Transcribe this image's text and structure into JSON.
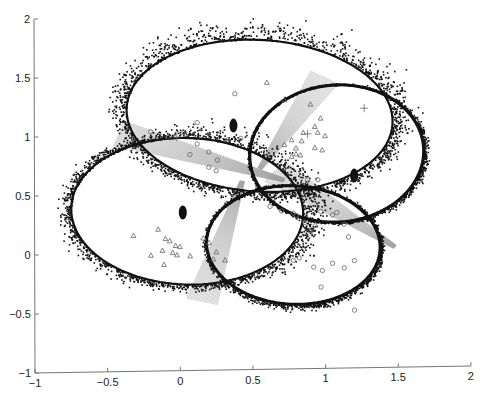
{
  "chart_data": {
    "type": "scatter",
    "title": "",
    "xlabel": "",
    "ylabel": "",
    "xlim": [
      -1,
      2
    ],
    "ylim": [
      -1,
      2
    ],
    "grid": false,
    "legend": null,
    "x_ticks": [
      -1,
      -0.5,
      0,
      0.5,
      1,
      1.5,
      2
    ],
    "x_tick_labels": [
      "-1",
      "-0.5",
      "0",
      "0.5",
      "1",
      "1.5",
      "2"
    ],
    "y_ticks": [
      -1,
      -0.5,
      0,
      0.5,
      1,
      1.5,
      2
    ],
    "y_tick_labels": [
      "-1",
      "-0.5",
      "0",
      "0.5",
      "1",
      "1.5",
      "2"
    ],
    "ellipses": [
      {
        "name": "top-ellipse",
        "cx": 0.55,
        "cy": 1.15,
        "rx": 0.92,
        "ry": 0.64,
        "angle_deg": -8,
        "spread": 0.09,
        "color": "#111111"
      },
      {
        "name": "left-ellipse",
        "cx": 0.05,
        "cy": 0.35,
        "rx": 0.8,
        "ry": 0.62,
        "angle_deg": -6,
        "spread": 0.08,
        "color": "#111111"
      },
      {
        "name": "right-ellipse",
        "cx": 1.08,
        "cy": 0.82,
        "rx": 0.6,
        "ry": 0.58,
        "angle_deg": 15,
        "spread": 0.02,
        "color": "#111111"
      },
      {
        "name": "bottom-ellipse",
        "cx": 0.78,
        "cy": 0.05,
        "rx": 0.6,
        "ry": 0.5,
        "angle_deg": -10,
        "spread": 0.03,
        "color": "#111111"
      }
    ],
    "fans": [
      {
        "name": "left-fan",
        "from": [
          -0.42,
          1.02
        ],
        "to": [
          0.72,
          0.6
        ],
        "width": 0.1,
        "color": "#999999"
      },
      {
        "name": "upper-right-fan",
        "from": [
          1.0,
          1.47
        ],
        "to": [
          0.55,
          0.7
        ],
        "width": 0.1,
        "color": "#999999"
      },
      {
        "name": "lower-fan",
        "from": [
          0.15,
          -0.42
        ],
        "to": [
          0.43,
          0.6
        ],
        "width": 0.1,
        "color": "#999999"
      },
      {
        "name": "right-fan",
        "from": [
          0.65,
          0.68
        ],
        "to": [
          1.48,
          0.02
        ],
        "width": 0.1,
        "color": "#999999"
      }
    ],
    "series": [
      {
        "name": "circles",
        "marker": "o",
        "color": "#666666",
        "points": [
          [
            0.38,
            1.34
          ],
          [
            0.12,
            1.1
          ],
          [
            -0.2,
            1.03
          ],
          [
            -0.08,
            0.98
          ],
          [
            0.03,
            1.02
          ],
          [
            0.12,
            0.92
          ],
          [
            0.2,
            0.85
          ],
          [
            0.26,
            0.78
          ],
          [
            0.07,
            0.83
          ],
          [
            0.2,
            0.72
          ],
          [
            0.33,
            0.95
          ],
          [
            0.42,
            0.96
          ],
          [
            0.25,
            0.69
          ],
          [
            0.88,
            0.6
          ],
          [
            0.95,
            0.6
          ],
          [
            0.62,
            0.38
          ],
          [
            0.7,
            0.34
          ],
          [
            0.78,
            0.32
          ],
          [
            0.8,
            0.3
          ],
          [
            0.97,
            0.33
          ],
          [
            1.05,
            0.3
          ],
          [
            0.86,
            0.24
          ],
          [
            0.93,
            0.21
          ],
          [
            0.9,
            0.16
          ],
          [
            1.13,
            0.22
          ],
          [
            1.16,
            0.11
          ],
          [
            0.78,
            -0.08
          ],
          [
            0.82,
            -0.06
          ],
          [
            0.92,
            -0.14
          ],
          [
            0.98,
            -0.17
          ],
          [
            1.05,
            -0.11
          ],
          [
            1.13,
            -0.15
          ],
          [
            1.2,
            -0.09
          ],
          [
            0.52,
            -0.2
          ],
          [
            0.97,
            -0.31
          ],
          [
            1.2,
            -0.51
          ],
          [
            1.08,
            0.32
          ]
        ]
      },
      {
        "name": "triangles",
        "marker": "^",
        "color": "#666666",
        "points": [
          [
            0.6,
            1.43
          ],
          [
            0.72,
            1.28
          ],
          [
            0.9,
            1.24
          ],
          [
            0.97,
            1.12
          ],
          [
            0.93,
            1.05
          ],
          [
            0.95,
            1.0
          ],
          [
            0.85,
            1.0
          ],
          [
            1.0,
            0.97
          ],
          [
            0.77,
            0.94
          ],
          [
            0.84,
            0.93
          ],
          [
            0.72,
            0.9
          ],
          [
            0.8,
            0.87
          ],
          [
            0.93,
            0.87
          ],
          [
            0.98,
            0.85
          ],
          [
            0.8,
            0.82
          ],
          [
            0.77,
            0.8
          ],
          [
            0.83,
            0.81
          ],
          [
            -0.32,
            0.15
          ],
          [
            -0.15,
            0.2
          ],
          [
            -0.1,
            0.12
          ],
          [
            -0.07,
            0.1
          ],
          [
            -0.03,
            0.06
          ],
          [
            0.0,
            0.05
          ],
          [
            -0.12,
            0.02
          ],
          [
            -0.02,
            -0.02
          ],
          [
            -0.2,
            -0.02
          ],
          [
            -0.05,
            0.0
          ],
          [
            -0.11,
            -0.1
          ],
          [
            0.2,
            0.08
          ],
          [
            0.25,
            0.0
          ],
          [
            0.23,
            -0.06
          ],
          [
            0.31,
            -0.07
          ],
          [
            0.16,
            0.12
          ],
          [
            0.07,
            -0.03
          ]
        ]
      },
      {
        "name": "plus",
        "marker": "+",
        "color": "#666666",
        "points": [
          [
            0.88,
            0.99
          ],
          [
            -0.02,
            0.98
          ],
          [
            1.27,
            1.2
          ]
        ]
      }
    ]
  },
  "axes": {
    "x_labels": [
      "-1",
      "-0.5",
      "0",
      "0.5",
      "1",
      "1.5",
      "2"
    ],
    "y_labels": [
      "-1",
      "-0.5",
      "0",
      "0.5",
      "1",
      "1.5",
      "2"
    ]
  }
}
